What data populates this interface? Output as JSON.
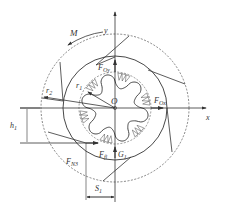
{
  "figure": {
    "labels": {
      "moment": "M",
      "y_axis": "y",
      "x_axis": "x",
      "origin": "O",
      "r2": "r",
      "r2_sub": "2",
      "r1": "r",
      "r1_sub": "1",
      "foy": "F",
      "foy_sub": "Oy",
      "fox": "F",
      "fox_sub": "Ox",
      "h1": "h",
      "h1_sub": "1",
      "fn3": "F",
      "fn3_sub": "N3",
      "ff": "F",
      "ff_sub": "fl",
      "g1": "G",
      "g1_sub": "1",
      "s1": "S",
      "s1_sub": "1"
    },
    "colors": {
      "line": "#333333",
      "background": "#ffffff"
    }
  }
}
